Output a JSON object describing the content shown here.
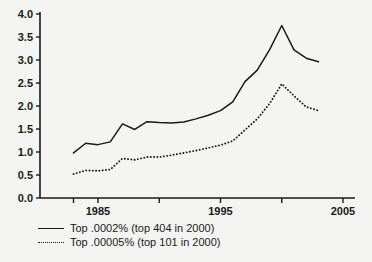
{
  "chart_data": {
    "type": "line",
    "title": "",
    "subtitle": "",
    "xlabel": "",
    "ylabel": "",
    "xlim": [
      1983,
      2005
    ],
    "ylim": [
      0.0,
      4.0
    ],
    "grid": false,
    "legend_position": "below-left",
    "y_ticks": [
      "0.0",
      "0.5",
      "1.0",
      "1.5",
      "2.0",
      "2.5",
      "3.0",
      "3.5",
      "4.0"
    ],
    "y_tick_values": [
      0.0,
      0.5,
      1.0,
      1.5,
      2.0,
      2.5,
      3.0,
      3.5,
      4.0
    ],
    "x_ticks": [
      "",
      "1985",
      "",
      "1995",
      "",
      "2005"
    ],
    "x_tick_values": [
      1983,
      1985,
      1990,
      1995,
      2000,
      2005
    ],
    "x_tick_labels_shown": [
      "1985",
      "1995",
      "2005"
    ],
    "x": [
      1983,
      1984,
      1985,
      1986,
      1987,
      1988,
      1989,
      1990,
      1991,
      1992,
      1993,
      1994,
      1995,
      1996,
      1997,
      1998,
      1999,
      2000,
      2001,
      2002,
      2003
    ],
    "series": [
      {
        "name": "Top .0002% (top 404 in 2000)",
        "style": "solid",
        "color": "#1a1a1a",
        "values": [
          0.98,
          1.19,
          1.16,
          1.22,
          1.61,
          1.49,
          1.66,
          1.64,
          1.63,
          1.65,
          1.72,
          1.8,
          1.9,
          2.09,
          2.53,
          2.78,
          3.22,
          3.75,
          3.22,
          3.04,
          2.96
        ]
      },
      {
        "name": "Top .00005% (top 101 in 2000)",
        "style": "dotted",
        "color": "#1a1a1a",
        "values": [
          0.52,
          0.6,
          0.59,
          0.62,
          0.86,
          0.83,
          0.89,
          0.89,
          0.93,
          0.98,
          1.03,
          1.09,
          1.15,
          1.24,
          1.48,
          1.72,
          2.05,
          2.48,
          2.22,
          1.98,
          1.9
        ]
      }
    ]
  },
  "legend": {
    "entries": [
      {
        "label": "Top .0002% (top 404 in 2000)",
        "style": "solid"
      },
      {
        "label": "Top .00005% (top 101 in 2000)",
        "style": "dotted"
      }
    ]
  }
}
